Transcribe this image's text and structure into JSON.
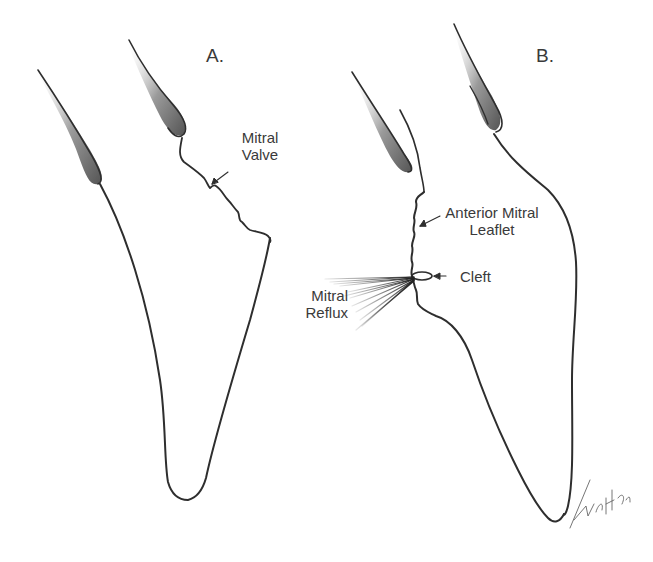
{
  "figure": {
    "panels": [
      {
        "id": "A",
        "label": "A."
      },
      {
        "id": "B",
        "label": "B."
      }
    ],
    "annotations": {
      "mitral_valve": {
        "line1": "Mitral",
        "line2": "Valve"
      },
      "anterior_mitral_leaflet": {
        "line1": "Anterior Mitral",
        "line2": "Leaflet"
      },
      "cleft": {
        "text": "Cleft"
      },
      "mitral_reflux": {
        "line1": "Mitral",
        "line2": "Reflux"
      }
    },
    "signature": "Finch '67",
    "colors": {
      "line": "#2e2e2e",
      "text": "#3a3a3a",
      "background": "#ffffff"
    }
  }
}
